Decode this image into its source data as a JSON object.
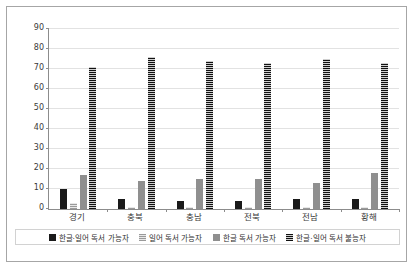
{
  "chart_data": {
    "type": "bar",
    "title": "",
    "xlabel": "",
    "ylabel": "",
    "ylim": [
      0,
      90
    ],
    "yticks": [
      0,
      10,
      20,
      30,
      40,
      50,
      60,
      70,
      80,
      90
    ],
    "grid": true,
    "legend_position": "bottom",
    "categories": [
      "경기",
      "충북",
      "충남",
      "전북",
      "전남",
      "황해"
    ],
    "series": [
      {
        "name": "한글·일어 독서 가능자",
        "values": [
          10,
          5,
          4,
          4,
          5,
          5
        ]
      },
      {
        "name": "일어 독서 가능자",
        "values": [
          3,
          1,
          1,
          1,
          1,
          1
        ]
      },
      {
        "name": "한글 독서 가능자",
        "values": [
          17,
          14,
          15,
          15,
          13,
          18
        ]
      },
      {
        "name": "한글·일어 독서 불능자",
        "values": [
          71,
          76,
          74,
          73,
          75,
          73
        ]
      }
    ],
    "colors": {
      "series0": "#1a1a1a",
      "series1": "#c9c9c9",
      "series2": "#8f8f8f",
      "series3": "#2b2b2b",
      "gridline": "#e2e2e2",
      "axis": "#8c8c8c",
      "border": "#a6a6a6",
      "background": "#ffffff"
    }
  }
}
